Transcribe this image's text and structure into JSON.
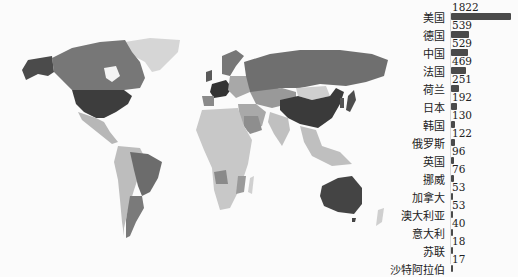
{
  "chart_data": [
    {
      "type": "choropleth-map",
      "title": "",
      "description": "World map shaded by value; darker = higher",
      "shading": {
        "highest": "#3f3f3f",
        "high": "#6a6a6a",
        "medium": "#8f8f8f",
        "low": "#b8b8b8",
        "none": "#dcdcdc"
      },
      "regions_highlighted": [
        "美国",
        "德国",
        "中国",
        "法国",
        "荷兰",
        "日本",
        "韩国",
        "俄罗斯",
        "英国",
        "挪威",
        "加拿大",
        "澳大利亚",
        "意大利",
        "苏联",
        "沙特阿拉伯"
      ]
    },
    {
      "type": "bar",
      "orientation": "horizontal",
      "title": "",
      "xlabel": "",
      "ylabel": "",
      "grid": false,
      "legend": "none",
      "categories": [
        "美国",
        "德国",
        "中国",
        "法国",
        "荷兰",
        "日本",
        "韩国",
        "俄罗斯",
        "英国",
        "挪威",
        "加拿大",
        "澳大利亚",
        "意大利",
        "苏联",
        "沙特阿拉伯"
      ],
      "values": [
        1822,
        539,
        529,
        469,
        251,
        192,
        130,
        122,
        96,
        76,
        53,
        53,
        40,
        18,
        17
      ],
      "bar_color": "#4a4a4a",
      "xlim": [
        0,
        1822
      ]
    }
  ],
  "bars": [
    {
      "label": "美国",
      "value": "1822",
      "n": 1822
    },
    {
      "label": "德国",
      "value": "539",
      "n": 539
    },
    {
      "label": "中国",
      "value": "529",
      "n": 529
    },
    {
      "label": "法国",
      "value": "469",
      "n": 469
    },
    {
      "label": "荷兰",
      "value": "251",
      "n": 251
    },
    {
      "label": "日本",
      "value": "192",
      "n": 192
    },
    {
      "label": "韩国",
      "value": "130",
      "n": 130
    },
    {
      "label": "俄罗斯",
      "value": "122",
      "n": 122
    },
    {
      "label": "英国",
      "value": "96",
      "n": 96
    },
    {
      "label": "挪威",
      "value": "76",
      "n": 76
    },
    {
      "label": "加拿大",
      "value": "53",
      "n": 53
    },
    {
      "label": "澳大利亚",
      "value": "53",
      "n": 53
    },
    {
      "label": "意大利",
      "value": "40",
      "n": 40
    },
    {
      "label": "苏联",
      "value": "18",
      "n": 18
    },
    {
      "label": "沙特阿拉伯",
      "value": "17",
      "n": 17
    }
  ]
}
